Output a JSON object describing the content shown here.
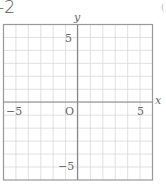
{
  "header": {
    "label": "-2"
  },
  "graph": {
    "x_label": "x",
    "y_label": "y",
    "origin_label": "O",
    "x_ticks": [
      {
        "value": -5,
        "label": "−5"
      },
      {
        "value": 5,
        "label": "5"
      }
    ],
    "y_ticks": [
      {
        "value": 5,
        "label": "5"
      },
      {
        "value": -5,
        "label": "−5"
      }
    ],
    "range": {
      "xmin": -6,
      "xmax": 6,
      "ymin": -6,
      "ymax": 6
    },
    "grid_color": "#d9d9d9",
    "axis_color": "#888888",
    "border_color": "#999999"
  },
  "side_mark": "("
}
